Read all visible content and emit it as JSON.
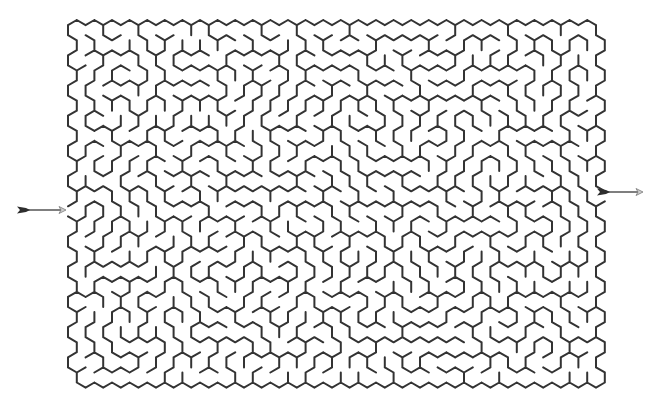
{
  "maze": {
    "type": "hexagonal",
    "cols": 30,
    "rows": 24,
    "origin_x": 68,
    "origin_y": 20,
    "hex_width": 17.6,
    "row_pitch": 15.1,
    "seed": 7321,
    "wall_color": "#333333",
    "background": "#ffffff"
  },
  "entrance": {
    "label": "start-arrow",
    "side": "left",
    "x1": 17,
    "x2": 66,
    "y": 210,
    "row": 12
  },
  "exit": {
    "label": "end-arrow",
    "side": "right",
    "x1": 597,
    "x2": 643,
    "y": 192,
    "row": 11
  }
}
